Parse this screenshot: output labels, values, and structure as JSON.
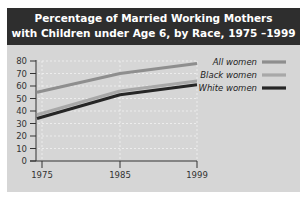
{
  "chart_data": {
    "type": "line",
    "title": "Percentage of Married Working Mothers with Children under Age 6, by Race, 1975 –1999",
    "title_lines": [
      "Percentage of Married Working Mothers",
      "with Children under Age 6, by Race, 1975 –1999"
    ],
    "xlabel": "",
    "ylabel": "",
    "x": [
      1975,
      1985,
      1999
    ],
    "x_tick_labels": [
      "1975",
      "1985",
      "1999"
    ],
    "y_ticks": [
      0,
      10,
      20,
      30,
      40,
      50,
      60,
      70,
      80
    ],
    "ylim": [
      0,
      80
    ],
    "grid": true,
    "legend_position": "upper right",
    "series": [
      {
        "name": "All women",
        "values": [
          55,
          70,
          78
        ],
        "color": "#8e8e8e"
      },
      {
        "name": "Black women",
        "values": [
          37,
          56,
          64
        ],
        "color": "#a8a8a8"
      },
      {
        "name": "White women",
        "values": [
          34,
          53,
          61
        ],
        "color": "#262626"
      }
    ]
  },
  "colors": {
    "title_bg": "#2e2e2e",
    "panel_bg": "#d6d6d6",
    "grid": "#f2f2f2"
  }
}
